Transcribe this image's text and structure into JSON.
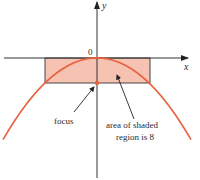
{
  "diagram": {
    "type": "parabola-with-latus-rectum",
    "axes": {
      "x_label": "x",
      "y_label": "y",
      "origin_label": "0"
    },
    "annotations": {
      "focus": "focus",
      "area_line1": "area of shaded",
      "area_line2": "region is 8"
    },
    "colors": {
      "curve": "#e8623f",
      "shade": "#f6c2b2",
      "axis": "#333333",
      "rect_border": "#444444"
    }
  }
}
